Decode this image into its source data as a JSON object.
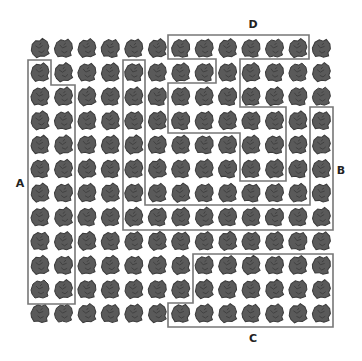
{
  "figure": {
    "grid": {
      "columns": 13,
      "rows": 12,
      "origin_x": 40,
      "origin_y": 48,
      "col_spacing": 23.45,
      "row_spacing": 24.1,
      "icon": "rock-icon",
      "icon_size": 18,
      "icon_color": "#5a5a5a"
    },
    "line_color": "#777777",
    "regions": [
      {
        "label": "A",
        "cell_count": 19,
        "label_pos": [
          20,
          183
        ],
        "points": [
          [
            28,
            60
          ],
          [
            51,
            60
          ],
          [
            51,
            85
          ],
          [
            75,
            85
          ],
          [
            75,
            304
          ],
          [
            28,
            304
          ]
        ]
      },
      {
        "label": "B",
        "cell_count": 19,
        "label_pos": [
          341,
          170
        ],
        "points": [
          [
            123,
            60
          ],
          [
            145,
            60
          ],
          [
            145,
            205
          ],
          [
            310,
            205
          ],
          [
            310,
            107
          ],
          [
            333,
            107
          ],
          [
            333,
            230
          ],
          [
            123,
            230
          ]
        ]
      },
      {
        "label": "C",
        "cell_count": 19,
        "label_pos": [
          253,
          338
        ],
        "points": [
          [
            193,
            254
          ],
          [
            333,
            254
          ],
          [
            333,
            327
          ],
          [
            168,
            327
          ],
          [
            168,
            303
          ],
          [
            193,
            303
          ]
        ]
      },
      {
        "label": "D",
        "cell_count": 19,
        "label_pos": [
          253,
          24
        ],
        "points": [
          [
            168,
            35
          ],
          [
            309,
            35
          ],
          [
            309,
            59
          ],
          [
            240,
            59
          ],
          [
            240,
            107
          ],
          [
            286,
            107
          ],
          [
            286,
            181
          ],
          [
            240,
            181
          ],
          [
            240,
            133
          ],
          [
            168,
            133
          ],
          [
            168,
            83
          ],
          [
            216,
            83
          ],
          [
            216,
            59
          ],
          [
            168,
            59
          ]
        ]
      }
    ]
  }
}
